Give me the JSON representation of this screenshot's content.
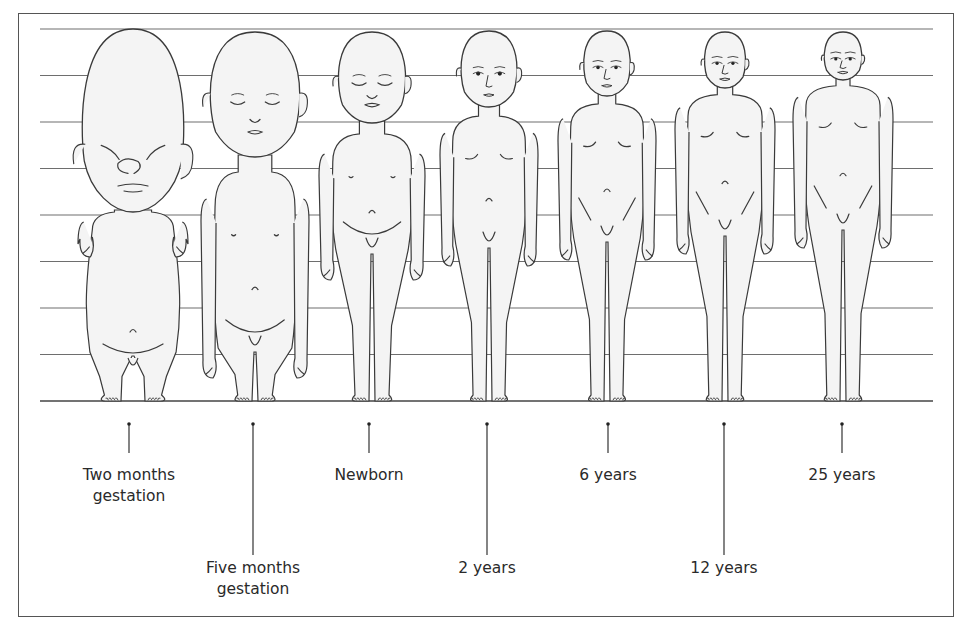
{
  "figure": {
    "grid_divisions": 8,
    "stages": [
      {
        "id": "two-months-gestation",
        "label_lines": [
          "Two months",
          "gestation"
        ],
        "label_row": "upper",
        "head_fraction_of_height": 0.5
      },
      {
        "id": "five-months-gestation",
        "label_lines": [
          "Five months",
          "gestation"
        ],
        "label_row": "lower",
        "head_fraction_of_height": 0.34
      },
      {
        "id": "newborn",
        "label_lines": [
          "Newborn"
        ],
        "label_row": "upper",
        "head_fraction_of_height": 0.25
      },
      {
        "id": "2-years",
        "label_lines": [
          "2 years"
        ],
        "label_row": "lower",
        "head_fraction_of_height": 0.2
      },
      {
        "id": "6-years",
        "label_lines": [
          "6 years"
        ],
        "label_row": "upper",
        "head_fraction_of_height": 0.17
      },
      {
        "id": "12-years",
        "label_lines": [
          "12 years"
        ],
        "label_row": "lower",
        "head_fraction_of_height": 0.15
      },
      {
        "id": "25-years",
        "label_lines": [
          "25 years"
        ],
        "label_row": "upper",
        "head_fraction_of_height": 0.13
      }
    ]
  },
  "colors": {
    "line": "#3a3a3a",
    "grid": "#6e6e6e",
    "skin": "#f4f4f4",
    "text": "#2a2a2a"
  }
}
